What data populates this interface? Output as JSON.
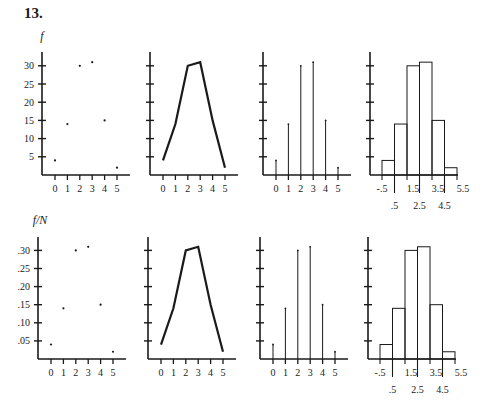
{
  "heading": "13.",
  "colors": {
    "ink": "#1a1a1a",
    "background": "#ffffff"
  },
  "rows": [
    {
      "ylabel": "f",
      "yticks": [
        "5",
        "10",
        "15",
        "20",
        "25",
        "30"
      ],
      "ytick_values": [
        5,
        10,
        15,
        20,
        25,
        30
      ],
      "ymax_unit": 5,
      "values": [
        4,
        14,
        30,
        31,
        15,
        2
      ],
      "axis_y": 175,
      "axis_top": 52,
      "unit_px": 18.2,
      "x_origins": [
        42,
        150,
        263,
        370
      ],
      "label_y": 40
    },
    {
      "ylabel": "f/N",
      "yticks": [
        ".05",
        ".10",
        ".15",
        ".20",
        ".25",
        ".30"
      ],
      "ytick_values": [
        5,
        10,
        15,
        20,
        25,
        30
      ],
      "ymax_unit": 5,
      "values": [
        4,
        14,
        30,
        31,
        15,
        2
      ],
      "axis_y": 359,
      "axis_top": 237,
      "unit_px": 18.1,
      "x_origins": [
        38,
        148,
        260,
        368
      ],
      "label_y": 224
    }
  ],
  "chart_data": [
    {
      "type": "scatter",
      "panel": "top-1",
      "title": "",
      "xlabel": "",
      "ylabel": "f",
      "x": [
        0,
        1,
        2,
        3,
        4,
        5
      ],
      "values": [
        4,
        14,
        30,
        31,
        15,
        2
      ],
      "yticks": [
        5,
        10,
        15,
        20,
        25,
        30
      ],
      "ylim": [
        0,
        33
      ],
      "grid": false
    },
    {
      "type": "line",
      "panel": "top-2",
      "title": "",
      "xlabel": "",
      "ylabel": "f",
      "x": [
        0,
        1,
        2,
        3,
        4,
        5
      ],
      "values": [
        4,
        14,
        30,
        31,
        15,
        2
      ],
      "ylim": [
        0,
        33
      ],
      "grid": false
    },
    {
      "type": "bar",
      "panel": "top-3",
      "subtype": "stem",
      "title": "",
      "ylabel": "f",
      "categories": [
        "0",
        "1",
        "2",
        "3",
        "4",
        "5"
      ],
      "values": [
        4,
        14,
        30,
        31,
        15,
        2
      ],
      "ylim": [
        0,
        33
      ]
    },
    {
      "type": "bar",
      "panel": "top-4",
      "subtype": "histogram",
      "title": "",
      "ylabel": "f",
      "bin_edges": [
        -0.5,
        0.5,
        1.5,
        2.5,
        3.5,
        4.5,
        5.5
      ],
      "xtick_labels_upper": [
        "-.5",
        "1.5",
        "3.5",
        "5.5"
      ],
      "xtick_labels_lower": [
        ".5",
        "2.5",
        "4.5"
      ],
      "values": [
        4,
        14,
        30,
        31,
        15,
        2
      ],
      "ylim": [
        0,
        33
      ]
    },
    {
      "type": "scatter",
      "panel": "bottom-1",
      "title": "",
      "ylabel": "f/N",
      "x": [
        0,
        1,
        2,
        3,
        4,
        5
      ],
      "values": [
        0.04,
        0.14,
        0.3,
        0.31,
        0.15,
        0.02
      ],
      "yticks": [
        0.05,
        0.1,
        0.15,
        0.2,
        0.25,
        0.3
      ],
      "ylim": [
        0,
        0.33
      ],
      "grid": false
    },
    {
      "type": "line",
      "panel": "bottom-2",
      "title": "",
      "ylabel": "f/N",
      "x": [
        0,
        1,
        2,
        3,
        4,
        5
      ],
      "values": [
        0.04,
        0.14,
        0.3,
        0.31,
        0.15,
        0.02
      ],
      "ylim": [
        0,
        0.33
      ]
    },
    {
      "type": "bar",
      "panel": "bottom-3",
      "subtype": "stem",
      "title": "",
      "ylabel": "f/N",
      "categories": [
        "0",
        "1",
        "2",
        "3",
        "4",
        "5"
      ],
      "values": [
        0.04,
        0.14,
        0.3,
        0.31,
        0.15,
        0.02
      ],
      "ylim": [
        0,
        0.33
      ]
    },
    {
      "type": "bar",
      "panel": "bottom-4",
      "subtype": "histogram",
      "title": "",
      "ylabel": "f/N",
      "bin_edges": [
        -0.5,
        0.5,
        1.5,
        2.5,
        3.5,
        4.5,
        5.5
      ],
      "xtick_labels_upper": [
        "-.5",
        "1.5",
        "3.5",
        "5.5"
      ],
      "xtick_labels_lower": [
        ".5",
        "2.5",
        "4.5"
      ],
      "values": [
        0.04,
        0.14,
        0.3,
        0.31,
        0.15,
        0.02
      ],
      "ylim": [
        0,
        0.33
      ]
    }
  ],
  "xtick_labels": [
    "0",
    "1",
    "2",
    "3",
    "4",
    "5"
  ],
  "hist_upper_labels": [
    "-.5",
    "1.5",
    "3.5",
    "5.5"
  ],
  "hist_lower_labels": [
    ".5",
    "2.5",
    "4.5"
  ]
}
